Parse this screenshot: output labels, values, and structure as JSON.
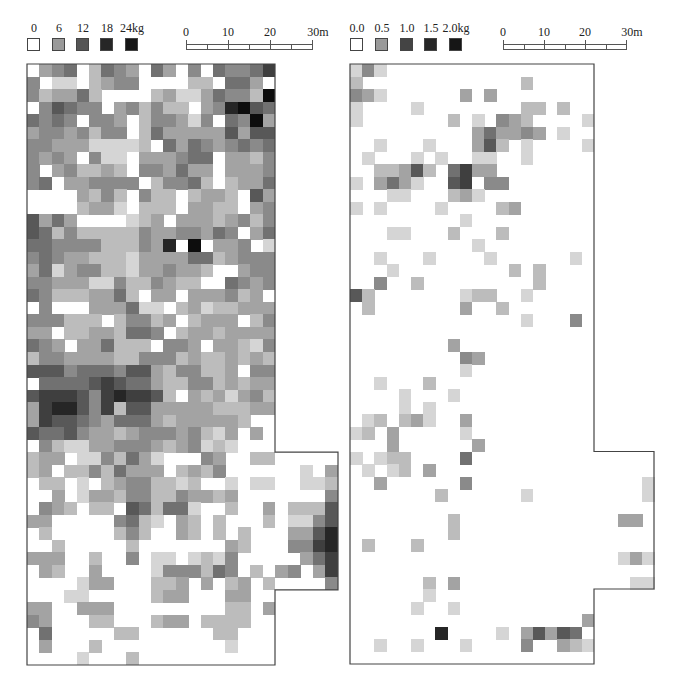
{
  "figure": {
    "panels": [
      {
        "id": "left",
        "legend": {
          "unit": "kg",
          "labels": [
            "0",
            "6",
            "12",
            "18",
            "24kg"
          ],
          "colors": [
            "#ffffff",
            "#9a9a9a",
            "#555555",
            "#262626",
            "#161616"
          ]
        },
        "scalebar": {
          "labels": [
            "0",
            "10",
            "20",
            "30m"
          ]
        }
      },
      {
        "id": "right",
        "legend": {
          "unit": "kg",
          "labels": [
            "0.0",
            "0.5",
            "1.0",
            "1.5",
            "2.0kg"
          ],
          "colors": [
            "#ffffff",
            "#9a9a9a",
            "#444444",
            "#262626",
            "#161616"
          ]
        },
        "scalebar": {
          "labels": [
            "0",
            "10",
            "20",
            "30m"
          ]
        }
      }
    ]
  },
  "chart_data": [
    {
      "type": "heatmap",
      "title": "",
      "legend_labels": [
        "0",
        "6",
        "12",
        "18",
        "24kg"
      ],
      "value_range": [
        0,
        24
      ],
      "unit": "kg",
      "scale_labels": [
        "0",
        "10",
        "20",
        "30m"
      ],
      "grid": {
        "cols_main": 20,
        "rows": 48,
        "ext_cols": 5,
        "ext_row_start": 31,
        "ext_row_end": 41
      },
      "note": "values are intensity 0-9 (0=white, 9=black) per grid cell; rows top->bottom",
      "rows": [
        "03450254305304054457",
        "40110234400002205530",
        "42335200002311354429",
        "04654403424220348965",
        "54540443024431405493",
        "34434244025333336366",
        "44333111120535434545",
        "43430411033345503324",
        "40342232044353303334",
        "45033444402445202335",
        "00003242042202332063",
        "00002331022203322034",
        "63530000123033323424",
        "65242222243344354035",
        "55444422243809033401",
        "45433222133335523444",
        "35134422133433200344",
        "44333114224322005434",
        "54222335203303334230",
        "04000333511023122333",
        "44422202442302333024",
        "33022332554023323333",
        "54303352220443033214",
        "24433332244423223232",
        "66645554663244223044",
        "05555676553224423233",
        "67776478776203231342",
        "37886472663333322233",
        "37665435553233333200",
        "65564332344434213030",
        "04211334443234121000",
        "23301142531000430022",
        "23022425333023240000",
        "02201023442212001011",
        "00301332442243323000",
        "04320220652551002003",
        "33000004521032020002",
        "02000002420032020200",
        "00200000200000003200",
        "33300200401101214000",
        "03200300001444254020",
        "00001330002230302302",
        "00011000002330003300",
        "33003330000000002203",
        "43000220002330222200",
        "05000002200000022000",
        "03000200000000001000",
        "00001000200000000000"
      ],
      "ext_rows": [
        "00000",
        "00103",
        "00112",
        "00004",
        "02226",
        "01146",
        "03368",
        "04478",
        "00357",
        "34037",
        "00004"
      ]
    },
    {
      "type": "heatmap",
      "title": "",
      "legend_labels": [
        "0.0",
        "0.5",
        "1.0",
        "1.5",
        "2.0kg"
      ],
      "value_range": [
        0,
        2.0
      ],
      "unit": "kg",
      "scale_labels": [
        "0",
        "10",
        "20",
        "30m"
      ],
      "grid": {
        "cols_main": 20,
        "rows": 48,
        "ext_cols": 5,
        "ext_row_start": 31,
        "ext_row_end": 41
      },
      "note": "values are intensity 0-9 (0=white, 9=black) per grid cell; rows top->bottom",
      "rows": [
        "14100000000000000000",
        "20000000000000200000",
        "43100000030300000000",
        "10000100000000220200",
        "10000000201043200001",
        "00000000003533430100",
        "00100010003620100001",
        "01000101001100100000",
        "00223620573300000000",
        "10353100670440000000",
        "00011000231000000000",
        "10100001000023000000",
        "00000000010000000000",
        "00011000200020000000",
        "00000000001000000000",
        "00100010000100000010",
        "00010000000002020000",
        "00400200000000020000",
        "62000000012200100000",
        "02000000030020000000",
        "00000000000000100040",
        "00000000000000000000",
        "00000000300000000000",
        "00000000043000000000",
        "00000000010000000000",
        "00100020000000000000",
        "00001000100000000000",
        "00001010000000000000",
        "01202310030000000000",
        "12030000010000000000",
        "00030000003000000000",
        "10122000050000000000",
        "01012030000000000000",
        "00300000040000000000",
        "00000002000000100000",
        "00000000000000000000",
        "00000000200000000000",
        "00000000200000000000",
        "02000200000000000000",
        "00000000000000000000",
        "00000000000000000000",
        "00000020300000000000",
        "00000010000000000000",
        "00000100100000000000",
        "00000000000000000003",
        "00000008000010363650",
        "00100100010000400321",
        "00000000000000000000"
      ],
      "ext_rows": [
        "00000",
        "00000",
        "00001",
        "00001",
        "00000",
        "00330",
        "00000",
        "00000",
        "00131",
        "00000",
        "00011"
      ]
    }
  ]
}
